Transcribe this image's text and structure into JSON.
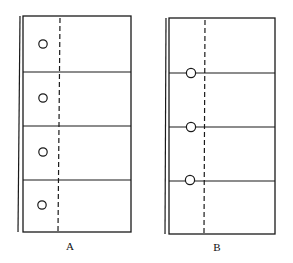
{
  "figures": [
    {
      "id": "A",
      "label": "A",
      "panels": 4,
      "description": "Frame divided into four stacked panels with a circle centered inside each panel, left of a vertical dashed line",
      "circle_placement": "inside-panel"
    },
    {
      "id": "B",
      "label": "B",
      "panels": 4,
      "description": "Frame divided into four stacked panels with circles placed on the dividing lines between panels, left of a vertical dashed line",
      "circle_placement": "on-divider"
    }
  ],
  "colors": {
    "stroke": "#1a1a1a",
    "background": "#ffffff"
  }
}
